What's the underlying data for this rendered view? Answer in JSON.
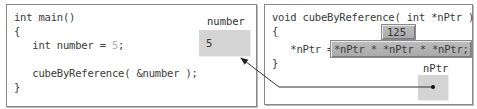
{
  "left_panel": {
    "code_lines": [
      "int main()",
      "{",
      "   int number = ",
      "",
      "   cubeByReference( &number );",
      "}"
    ],
    "number_literal": "5",
    "number_literal_suffix": ";",
    "variable": {
      "label": "number",
      "value": "5"
    }
  },
  "right_panel": {
    "code_lines": [
      "void cubeByReference( int *nPtr )",
      "{",
      "   *nPtr = ",
      "}"
    ],
    "expression": "*nPtr * *nPtr * *nPtr;",
    "result_badge": "125",
    "pointer": {
      "label": "nPtr"
    }
  },
  "colors": {
    "panel_border": "#888888",
    "variable_box": "#d4d4d4",
    "highlight_box": "#ababab",
    "arrow": "#222222"
  }
}
